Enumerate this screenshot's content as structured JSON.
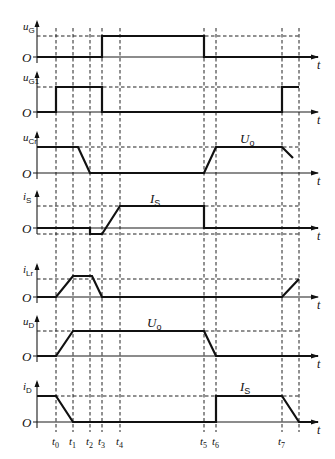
{
  "diagram": {
    "type": "timing-waveform",
    "time_axis_label": "t",
    "origin_label": "O",
    "time_marks": [
      {
        "name": "t0",
        "base": "t",
        "sub": "0",
        "x": 56
      },
      {
        "name": "t1",
        "base": "t",
        "sub": "1",
        "x": 73
      },
      {
        "name": "t2",
        "base": "t",
        "sub": "2",
        "x": 90
      },
      {
        "name": "t3",
        "base": "t",
        "sub": "3",
        "x": 102
      },
      {
        "name": "t4",
        "base": "t",
        "sub": "4",
        "x": 120
      },
      {
        "name": "t5",
        "base": "t",
        "sub": "5",
        "x": 204
      },
      {
        "name": "t6",
        "base": "t",
        "sub": "6",
        "x": 216
      },
      {
        "name": "t7",
        "base": "t",
        "sub": "7",
        "x": 282
      }
    ],
    "end_mark_x": 299,
    "traces": [
      {
        "id": "uG",
        "base": "u",
        "sub": "G",
        "baseline_y": 57,
        "level_y": 36,
        "description": "Low from 0 to t3, high from t3 to t5, low after t5",
        "points": [
          [
            37,
            57
          ],
          [
            102,
            57
          ],
          [
            102,
            36
          ],
          [
            204,
            36
          ],
          [
            204,
            57
          ],
          [
            318,
            57
          ]
        ],
        "annotation": null
      },
      {
        "id": "uG1",
        "base": "u",
        "sub": "G1",
        "baseline_y": 112,
        "level_y": 87,
        "description": "High from t0 to t3, low until t7, high after t7",
        "points": [
          [
            37,
            112
          ],
          [
            56,
            112
          ],
          [
            56,
            87
          ],
          [
            102,
            87
          ],
          [
            102,
            112
          ],
          [
            282,
            112
          ],
          [
            282,
            87
          ],
          [
            299,
            87
          ]
        ],
        "annotation": null
      },
      {
        "id": "uCr",
        "base": "u",
        "sub": "Cr",
        "baseline_y": 173,
        "level_y": 147,
        "description": "At Uo until just after t1, falls to 0 at t2, rises from t5 to Uo at t6, falls after t7",
        "points_segments": [
          [
            [
              37,
              147
            ],
            [
              78,
              147
            ],
            [
              90,
              173
            ],
            [
              204,
              173
            ],
            [
              216,
              147
            ],
            [
              282,
              147
            ],
            [
              293,
              158
            ]
          ]
        ],
        "annotation": {
          "base": "U",
          "sub": "o",
          "x": 240,
          "y": 143
        }
      },
      {
        "id": "iS",
        "base": "i",
        "sub": "S",
        "baseline_y": 228,
        "level_y": 206,
        "neg_level_y": 234,
        "description": "Negative between t2 and t3, rises to IS at t4, drops to 0 at t5",
        "points": [
          [
            37,
            228
          ],
          [
            90,
            228
          ],
          [
            90,
            234
          ],
          [
            102,
            234
          ],
          [
            120,
            206
          ],
          [
            204,
            206
          ],
          [
            204,
            228
          ],
          [
            318,
            228
          ]
        ],
        "annotation": {
          "base": "I",
          "sub": "S",
          "x": 150,
          "y": 203
        }
      },
      {
        "id": "iLr",
        "base": "i",
        "sub": "Lr",
        "baseline_y": 297,
        "level_y": 279,
        "description": "Rises t0-t1, flat, falls to 0 at t3, rises after t7",
        "points_segments": [
          [
            [
              37,
              297
            ],
            [
              56,
              297
            ],
            [
              73,
              276
            ],
            [
              92,
              276
            ],
            [
              102,
              297
            ],
            [
              282,
              297
            ],
            [
              299,
              279
            ]
          ]
        ],
        "annotation": null
      },
      {
        "id": "uD",
        "base": "u",
        "sub": "D",
        "baseline_y": 356,
        "level_y": 331,
        "description": "Rises t0-t1 to Uo, flat until t5, falls to 0 at t6",
        "points": [
          [
            37,
            356
          ],
          [
            56,
            356
          ],
          [
            73,
            331
          ],
          [
            204,
            331
          ],
          [
            216,
            356
          ],
          [
            318,
            356
          ]
        ],
        "annotation": {
          "base": "U",
          "sub": "o",
          "x": 147,
          "y": 327
        }
      },
      {
        "id": "iD",
        "base": "i",
        "sub": "D",
        "baseline_y": 422,
        "level_y": 396,
        "description": "At IS until t0, falls to 0 at t1, steps to IS at t6, falls after t7 to 0 at end",
        "points": [
          [
            37,
            396
          ],
          [
            56,
            396
          ],
          [
            73,
            422
          ],
          [
            216,
            422
          ],
          [
            216,
            396
          ],
          [
            282,
            396
          ],
          [
            299,
            422
          ],
          [
            318,
            422
          ]
        ],
        "annotation": {
          "base": "I",
          "sub": "S",
          "x": 240,
          "y": 391
        }
      }
    ]
  }
}
